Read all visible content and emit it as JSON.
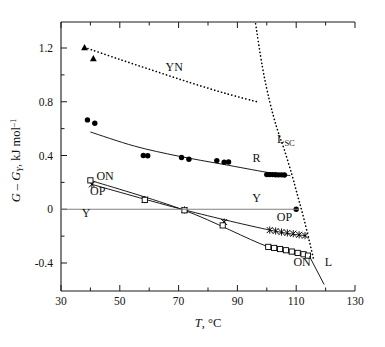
{
  "chart_data": {
    "type": "scatter",
    "title": "",
    "xlabel": "T, °C",
    "ylabel": "G – G_Y, kJ mol^-1",
    "xlabel_parts": {
      "italic": "T",
      "rest": ", °C"
    },
    "ylabel_parts": {
      "g1": "G",
      "dash": " – ",
      "g2": "G",
      "sub": "Y",
      "rest": ", kJ mol",
      "sup": "–1"
    },
    "xlim": [
      30,
      130
    ],
    "ylim": [
      -0.55,
      1.38
    ],
    "xticks": [
      30,
      50,
      70,
      90,
      110,
      130
    ],
    "xtick_labels": [
      "30",
      "50",
      "70",
      "90",
      "110",
      "130"
    ],
    "xminor_step": 10,
    "yticks": [
      1.2,
      0.8,
      0.4,
      0,
      -0.4
    ],
    "ytick_labels": [
      "1.2",
      "0.8",
      "0.4",
      "0",
      "-0.4"
    ],
    "yminor_step": 0.2,
    "grid": false,
    "legend_position": "inline-annotations",
    "annotations": [
      {
        "id": "ann-yn",
        "text": "YN",
        "x": 68.5,
        "y": 1.03
      },
      {
        "id": "ann-lsc",
        "text": "L",
        "sub": "SC",
        "x": 106.5,
        "y": 0.49
      },
      {
        "id": "ann-r",
        "text": "R",
        "x": 96.5,
        "y": 0.35
      },
      {
        "id": "ann-on-top",
        "text": "ON",
        "x": 45.0,
        "y": 0.215
      },
      {
        "id": "ann-op-left",
        "text": "OP",
        "x": 42.5,
        "y": 0.105
      },
      {
        "id": "ann-y-left",
        "text": "Y",
        "x": 38.5,
        "y": -0.055
      },
      {
        "id": "ann-y-right",
        "text": "Y",
        "x": 96.5,
        "y": 0.055
      },
      {
        "id": "ann-op-right",
        "text": "OP",
        "x": 106.0,
        "y": -0.085
      },
      {
        "id": "ann-on-bottom",
        "text": "ON",
        "x": 112.0,
        "y": -0.425
      },
      {
        "id": "ann-l",
        "text": "L",
        "x": 121.0,
        "y": -0.425
      }
    ],
    "series": [
      {
        "name": "YN",
        "style": "dotted-line-with-markers",
        "marker": "filled-triangle",
        "color": "#000000",
        "points": [
          {
            "x": 38.0,
            "y": 1.205
          },
          {
            "x": 41.0,
            "y": 1.122
          }
        ],
        "line_x": [
          38.0,
          50.0,
          62.0,
          74.0,
          86.0,
          97.5
        ],
        "line_y": [
          1.205,
          1.115,
          1.028,
          0.942,
          0.862,
          0.795
        ]
      },
      {
        "name": "L_SC",
        "style": "dotted-line",
        "color": "#000000",
        "line_x": [
          96.2,
          98.5,
          101.0,
          103.5,
          106.0,
          108.5,
          110.5,
          112.5,
          114.5,
          116.0
        ],
        "line_y": [
          1.38,
          1.06,
          0.8,
          0.6,
          0.44,
          0.26,
          0.1,
          -0.06,
          -0.24,
          -0.38
        ]
      },
      {
        "name": "R",
        "style": "solid-line-with-markers",
        "marker": "filled-circle",
        "color": "#000000",
        "points": [
          {
            "x": 39.0,
            "y": 0.665
          },
          {
            "x": 41.5,
            "y": 0.64
          },
          {
            "x": 58.0,
            "y": 0.4
          },
          {
            "x": 59.5,
            "y": 0.398
          },
          {
            "x": 71.0,
            "y": 0.385
          },
          {
            "x": 73.5,
            "y": 0.372
          },
          {
            "x": 83.0,
            "y": 0.362
          },
          {
            "x": 85.5,
            "y": 0.35
          },
          {
            "x": 87.0,
            "y": 0.352
          },
          {
            "x": 100.0,
            "y": 0.258
          },
          {
            "x": 101.0,
            "y": 0.258
          },
          {
            "x": 102.0,
            "y": 0.258
          },
          {
            "x": 103.0,
            "y": 0.257
          },
          {
            "x": 104.0,
            "y": 0.256
          },
          {
            "x": 105.0,
            "y": 0.256
          },
          {
            "x": 106.0,
            "y": 0.255
          },
          {
            "x": 110.0,
            "y": 0.0
          }
        ],
        "line_x": [
          40.0,
          55.0,
          70.0,
          85.0,
          100.0,
          108.0
        ],
        "line_y": [
          0.575,
          0.47,
          0.395,
          0.335,
          0.275,
          0.25
        ]
      },
      {
        "name": "OP",
        "style": "solid-line-with-markers",
        "marker": "cross-x",
        "color": "#000000",
        "points": [
          {
            "x": 40.5,
            "y": 0.185
          },
          {
            "x": 58.5,
            "y": 0.072
          },
          {
            "x": 72.0,
            "y": -0.005
          },
          {
            "x": 85.5,
            "y": -0.095
          },
          {
            "x": 101.0,
            "y": -0.155
          },
          {
            "x": 103.0,
            "y": -0.162
          },
          {
            "x": 105.0,
            "y": -0.17
          },
          {
            "x": 107.0,
            "y": -0.176
          },
          {
            "x": 109.0,
            "y": -0.182
          },
          {
            "x": 111.0,
            "y": -0.19
          },
          {
            "x": 113.0,
            "y": -0.196
          }
        ],
        "line_x": [
          40.5,
          72.0,
          101.0,
          113.5
        ],
        "line_y": [
          0.185,
          -0.005,
          -0.155,
          -0.198
        ]
      },
      {
        "name": "ON",
        "style": "solid-line-with-markers",
        "marker": "open-square",
        "color": "#000000",
        "points": [
          {
            "x": 40.0,
            "y": 0.215
          },
          {
            "x": 58.5,
            "y": 0.07
          },
          {
            "x": 72.0,
            "y": -0.008
          },
          {
            "x": 85.0,
            "y": -0.12
          },
          {
            "x": 100.5,
            "y": -0.28
          },
          {
            "x": 102.5,
            "y": -0.288
          },
          {
            "x": 104.5,
            "y": -0.296
          },
          {
            "x": 106.5,
            "y": -0.305
          },
          {
            "x": 108.5,
            "y": -0.315
          },
          {
            "x": 110.5,
            "y": -0.325
          },
          {
            "x": 112.5,
            "y": -0.335
          },
          {
            "x": 114.0,
            "y": -0.345
          }
        ],
        "line_x": [
          40.0,
          72.0,
          100.5,
          114.5
        ],
        "line_y": [
          0.215,
          -0.008,
          -0.28,
          -0.35
        ]
      },
      {
        "name": "L",
        "style": "solid-line",
        "color": "#000000",
        "line_x": [
          114.5,
          119.5
        ],
        "line_y": [
          -0.35,
          -0.56
        ]
      },
      {
        "name": "Y-baseline",
        "style": "solid-line",
        "color": "#808080",
        "line_x": [
          30.0,
          111.0
        ],
        "line_y": [
          0.0,
          0.0
        ]
      }
    ]
  }
}
